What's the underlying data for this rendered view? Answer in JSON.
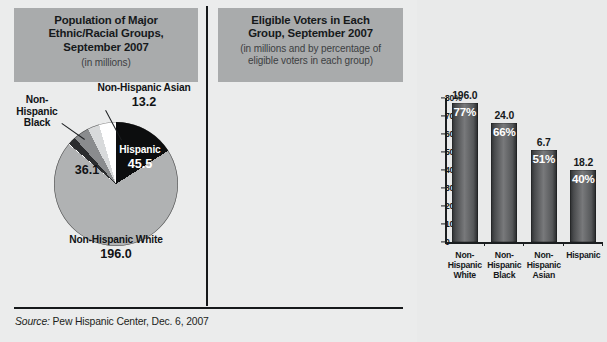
{
  "figure": {
    "source_prefix": "Source:",
    "source_text": " Pew Hispanic Center, Dec. 6, 2007"
  },
  "left_panel": {
    "title_line1": "Population of Major",
    "title_line2": "Ethnic/Racial Groups,",
    "title_line3": "September 2007",
    "subtitle": "(in millions)",
    "labels": {
      "asian_name": "Non-Hispanic Asian",
      "asian_value": "13.2",
      "black_name_l1": "Non-",
      "black_name_l2": "Hispanic",
      "black_name_l3": "Black",
      "black_value": "36.1",
      "hispanic_name": "Hispanic",
      "hispanic_value": "45.5",
      "white_name": "Non-Hispanic White",
      "white_value": "196.0"
    }
  },
  "right_panel": {
    "title_line1": "Eligible Voters in Each",
    "title_line2": "Group, September 2007",
    "subtitle_line1": "(in millions and by percentage of",
    "subtitle_line2": "eligible voters in each group)"
  },
  "chart_data": [
    {
      "type": "pie",
      "title": "Population of Major Ethnic/Racial Groups, September 2007",
      "subtitle": "(in millions)",
      "unit": "millions",
      "categories": [
        "Hispanic",
        "Non-Hispanic White",
        "Non-Hispanic Black",
        "Non-Hispanic Asian"
      ],
      "values": [
        45.5,
        196.0,
        36.1,
        13.2
      ],
      "colors": [
        "#0c0d0e",
        "#b0b2b3",
        "#8a8c8e",
        "#ffffff"
      ],
      "legend": "inline-labels",
      "start_angle_deg": 0,
      "direction": "clockwise"
    },
    {
      "type": "bar",
      "title": "Eligible Voters in Each Group, September 2007",
      "subtitle": "(in millions and by percentage of eligible voters in each group)",
      "categories": [
        "Non-Hispanic White",
        "Non-Hispanic Black",
        "Non-Hispanic Asian",
        "Hispanic"
      ],
      "series": [
        {
          "name": "Percentage of eligible voters in group",
          "values": [
            77,
            66,
            51,
            40
          ],
          "unit": "%"
        },
        {
          "name": "Eligible voters (millions)",
          "values": [
            196.0,
            24.0,
            6.7,
            18.2
          ],
          "unit": "millions"
        }
      ],
      "bar_value_labels": [
        "196.0",
        "24.0",
        "6.7",
        "18.2"
      ],
      "bar_pct_labels": [
        "77%",
        "66%",
        "51%",
        "40%"
      ],
      "ylabel": "",
      "xlabel": "",
      "ylim": [
        0,
        80
      ],
      "ytick_labels": [
        "80%",
        "70",
        "60",
        "50",
        "40",
        "30",
        "20",
        "10",
        "0"
      ],
      "ytick_values": [
        80,
        70,
        60,
        50,
        40,
        30,
        20,
        10,
        0
      ],
      "grid": false,
      "legend_position": "none"
    }
  ],
  "xcat_lines": [
    [
      "Non-",
      "Hispanic",
      "White"
    ],
    [
      "Non-",
      "Hispanic",
      "Black"
    ],
    [
      "Non-",
      "Hispanic",
      "Asian"
    ],
    [
      "Hispanic",
      "",
      ""
    ]
  ]
}
